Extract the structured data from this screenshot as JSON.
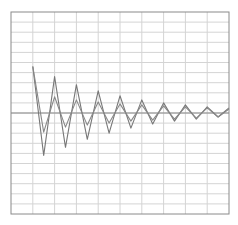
{
  "chart_data": {
    "type": "line",
    "title": "",
    "xlabel": "",
    "ylabel": "",
    "grid": true,
    "legend": "none",
    "xlim": [
      0,
      10
    ],
    "ylim": [
      -10,
      10
    ],
    "x_divisions": 10,
    "y_divisions": 20,
    "x": [
      1.0,
      1.5,
      2.0,
      2.5,
      3.0,
      3.5,
      4.0,
      4.5,
      5.0,
      5.5,
      6.0,
      6.5,
      7.0,
      7.5,
      8.0,
      8.5,
      9.0,
      9.5,
      10.0
    ],
    "series": [
      {
        "name": "signal-a",
        "color": "#777777",
        "values": [
          4.6,
          -4.2,
          3.6,
          -3.4,
          2.8,
          -2.6,
          2.2,
          -2.0,
          1.7,
          -1.5,
          1.3,
          -1.1,
          1.0,
          -0.8,
          0.8,
          -0.6,
          0.6,
          -0.4,
          0.5
        ]
      },
      {
        "name": "signal-b",
        "color": "#888888",
        "values": [
          4.6,
          -1.9,
          1.6,
          -1.4,
          1.3,
          -1.2,
          1.1,
          -1.0,
          0.9,
          -0.8,
          0.8,
          -0.7,
          0.7,
          -0.6,
          0.6,
          -0.5,
          0.5,
          -0.4,
          0.4
        ]
      }
    ]
  },
  "colors": {
    "frame": "#8a8a8a",
    "grid": "#d4d4d4",
    "axis": "#8a8a8a",
    "background": "#ffffff"
  }
}
